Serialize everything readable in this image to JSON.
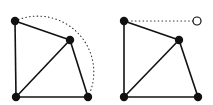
{
  "figure": {
    "width": 213,
    "height": 105,
    "background": "#ffffff",
    "stroke_color": "#111111",
    "panels": [
      {
        "name": "left-panel",
        "nodes": [
          {
            "id": "a",
            "x": 15,
            "y": 21,
            "filled": true
          },
          {
            "id": "b",
            "x": 70,
            "y": 40,
            "filled": true
          },
          {
            "id": "c",
            "x": 16,
            "y": 97,
            "filled": true
          },
          {
            "id": "d",
            "x": 88,
            "y": 97,
            "filled": true
          }
        ],
        "edges": [
          [
            "a",
            "b"
          ],
          [
            "a",
            "c"
          ],
          [
            "b",
            "c"
          ],
          [
            "b",
            "d"
          ],
          [
            "c",
            "d"
          ]
        ],
        "dotted_arc": {
          "from": "a",
          "to": "d",
          "radius": 56
        }
      },
      {
        "name": "right-panel",
        "nodes": [
          {
            "id": "a",
            "x": 124,
            "y": 21,
            "filled": true
          },
          {
            "id": "b",
            "x": 179,
            "y": 40,
            "filled": true
          },
          {
            "id": "c",
            "x": 124,
            "y": 97,
            "filled": true
          },
          {
            "id": "d",
            "x": 198,
            "y": 97,
            "filled": true
          },
          {
            "id": "e",
            "x": 197,
            "y": 21,
            "filled": false
          }
        ],
        "edges": [
          [
            "a",
            "b"
          ],
          [
            "a",
            "c"
          ],
          [
            "b",
            "c"
          ],
          [
            "b",
            "d"
          ],
          [
            "c",
            "d"
          ]
        ],
        "dotted_line": {
          "from": "a",
          "to": "e"
        }
      }
    ]
  }
}
